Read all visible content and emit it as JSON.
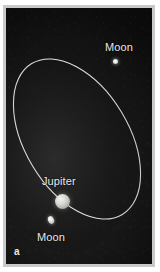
{
  "figure": {
    "panel_letter": "a",
    "caption_type": "orbital-diagram",
    "background_color": "#0d0d0d",
    "frame_color": "#c9c9c9",
    "label_color": "#e8e8e8",
    "orbit_color": "#d5d5d0"
  },
  "labels": {
    "moon_top": "Moon",
    "jupiter": "Jupiter",
    "moon_bottom": "Moon"
  },
  "bodies": [
    {
      "name": "Jupiter",
      "kind": "planet",
      "x": 56,
      "y": 193,
      "radius": 7.5,
      "color": "#d8d8d4"
    },
    {
      "name": "Moon",
      "kind": "moon",
      "position": "upper-right",
      "x": 109,
      "y": 53,
      "radius": 2.5,
      "color": "#e2e2dd"
    },
    {
      "name": "Moon",
      "kind": "moon",
      "position": "lower-left",
      "x": 45,
      "y": 212,
      "radius": 3,
      "color": "#dcdcd6"
    }
  ],
  "orbit": {
    "shape": "ellipse",
    "center_x": 74,
    "center_y": 135,
    "semi_major": 88,
    "semi_minor": 52,
    "rotation_deg": -31,
    "stroke_width": 1,
    "stroke_color": "#d5d5d0"
  }
}
